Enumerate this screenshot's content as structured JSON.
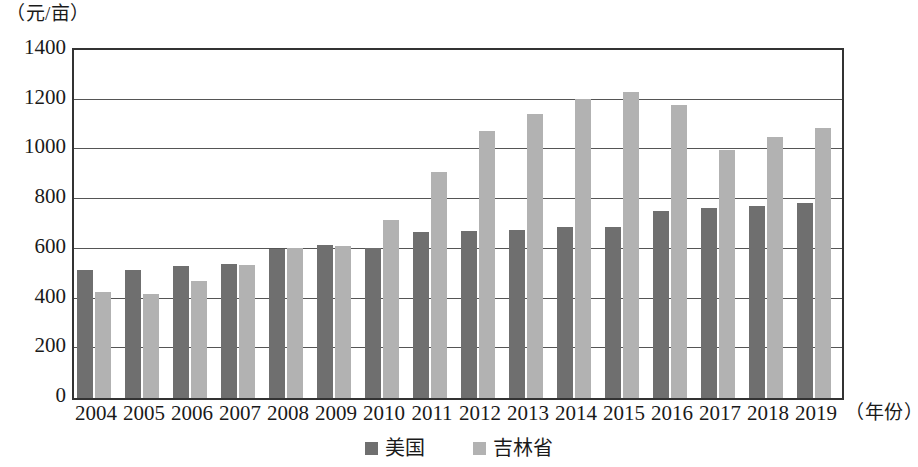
{
  "chart_data": {
    "type": "bar",
    "title": "",
    "subtitle": "",
    "xlabel": "（年份）",
    "ylabel": "（元/亩）",
    "categories": [
      "2004",
      "2005",
      "2006",
      "2007",
      "2008",
      "2009",
      "2010",
      "2011",
      "2012",
      "2013",
      "2014",
      "2015",
      "2016",
      "2017",
      "2018",
      "2019"
    ],
    "series": [
      {
        "name": "美国",
        "color": "#6f6f6f",
        "values": [
          515,
          517,
          530,
          540,
          600,
          617,
          603,
          667,
          673,
          676,
          686,
          690,
          753,
          763,
          772,
          786
        ]
      },
      {
        "name": "吉林省",
        "color": "#b2b2b2",
        "values": [
          428,
          418,
          470,
          535,
          604,
          610,
          718,
          910,
          1075,
          1143,
          1204,
          1231,
          1178,
          999,
          1052,
          1088
        ]
      }
    ],
    "ylim": [
      0,
      1400
    ],
    "yticks": [
      "0",
      "200",
      "400",
      "600",
      "800",
      "1000",
      "1200",
      "1400"
    ],
    "ytick_values": [
      0,
      200,
      400,
      600,
      800,
      1000,
      1200,
      1400
    ],
    "grid": true,
    "legend_position": "bottom-center",
    "legend": [
      {
        "label": "美国",
        "color": "#6f6f6f"
      },
      {
        "label": "吉林省",
        "color": "#b2b2b2"
      }
    ]
  }
}
